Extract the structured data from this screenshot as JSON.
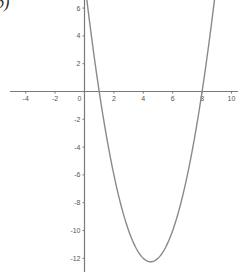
{
  "part_label": "b)",
  "chart_data": {
    "type": "line",
    "title": "",
    "xlabel": "",
    "ylabel": "",
    "function": "y = x^2 - 9x + 8",
    "xlim": [
      -4.9,
      10.6
    ],
    "ylim": [
      -13.3,
      6.55
    ],
    "grid": false,
    "x_ticks": [
      -4,
      -2,
      0,
      2,
      4,
      6,
      8,
      10
    ],
    "x_tick_labels": [
      "-4",
      "-2",
      "0",
      "2",
      "4",
      "6",
      "8",
      "10"
    ],
    "y_ticks": [
      6,
      4,
      2,
      -2,
      -4,
      -6,
      -8,
      -10,
      -12
    ],
    "y_tick_labels": [
      "6",
      "4",
      "2",
      "-2",
      "-4",
      "-6",
      "-8",
      "-10",
      "-12"
    ],
    "series": [
      {
        "name": "parabola",
        "color": "#8a8a8a",
        "x": [
          0.16,
          0.5,
          1,
          1.5,
          2,
          2.5,
          3,
          3.5,
          4,
          4.5,
          5,
          5.5,
          6,
          6.5,
          7,
          7.5,
          8,
          8.5,
          8.84
        ],
        "y": [
          6.55,
          3.75,
          0,
          -3.25,
          -6,
          -8.25,
          -10,
          -11.25,
          -12,
          -12.25,
          -12,
          -11.25,
          -10,
          -8.25,
          -6,
          -3.25,
          0,
          3.75,
          6.55
        ]
      }
    ],
    "roots": [
      1,
      8
    ],
    "vertex": [
      4.5,
      -12.25
    ]
  },
  "colors": {
    "axis": "#7a7a7a",
    "curve": "#8a8a8a",
    "label": "#555555"
  }
}
